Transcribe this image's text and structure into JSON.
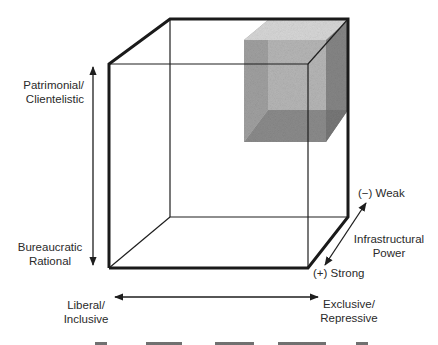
{
  "diagram": {
    "type": "3d-cube-typology",
    "vertical_axis": {
      "top_label_line1": "Patrimonial/",
      "top_label_line2": "Clientelistic",
      "bottom_label_line1": "Bureaucratic",
      "bottom_label_line2": "Rational"
    },
    "horizontal_axis": {
      "left_label_line1": "Liberal/",
      "left_label_line2": "Inclusive",
      "right_label_line1": "Exclusive/",
      "right_label_line2": "Repressive"
    },
    "depth_axis": {
      "title_line1": "Infrastructural",
      "title_line2": "Power",
      "back_label": "(−) Weak",
      "front_label": "(+) Strong"
    },
    "highlighted_region": {
      "description": "shaded sub-cube at patrimonial / exclusive / weak corner",
      "fill_light": "#bdbdbd",
      "fill_mid": "#8e8e8e",
      "fill_dark": "#5e5e5e"
    },
    "colors": {
      "line": "#1e1e1e",
      "background": "#ffffff"
    }
  }
}
